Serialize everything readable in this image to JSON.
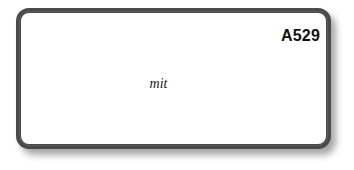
{
  "card": {
    "code": "A529",
    "label": "mit",
    "border_color": "#4a4a4a",
    "background_color": "#ffffff"
  }
}
